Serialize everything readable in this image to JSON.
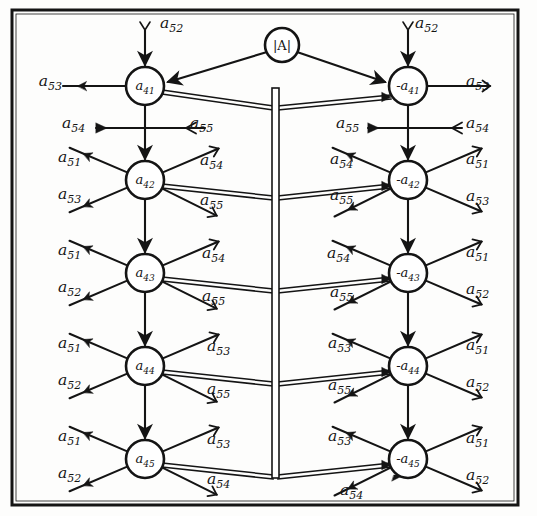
{
  "figure": {
    "background_color": "#fdfdfc",
    "ink_color": "#141414",
    "frame": {
      "x": 12,
      "y": 10,
      "width": 506,
      "height": 495,
      "stroke_width": 3
    }
  },
  "source_node": {
    "id": "det",
    "label": "|A|",
    "cx": 282,
    "cy": 45,
    "r": 17
  },
  "nodes": [
    {
      "id": "L1",
      "label": "a",
      "sub": "41",
      "sign": "",
      "cx": 145,
      "cy": 86,
      "r": 19,
      "side": "left"
    },
    {
      "id": "L2",
      "label": "a",
      "sub": "42",
      "sign": "",
      "cx": 145,
      "cy": 180,
      "r": 19,
      "side": "left"
    },
    {
      "id": "L3",
      "label": "a",
      "sub": "43",
      "sign": "",
      "cx": 145,
      "cy": 273,
      "r": 19,
      "side": "left"
    },
    {
      "id": "L4",
      "label": "a",
      "sub": "44",
      "sign": "",
      "cx": 145,
      "cy": 366,
      "r": 19,
      "side": "left"
    },
    {
      "id": "L5",
      "label": "a",
      "sub": "45",
      "sign": "",
      "cx": 145,
      "cy": 459,
      "r": 19,
      "side": "left"
    },
    {
      "id": "R1",
      "label": "a",
      "sub": "41",
      "sign": "-",
      "cx": 408,
      "cy": 86,
      "r": 19,
      "side": "right"
    },
    {
      "id": "R2",
      "label": "a",
      "sub": "42",
      "sign": "-",
      "cx": 408,
      "cy": 180,
      "r": 19,
      "side": "right"
    },
    {
      "id": "R3",
      "label": "a",
      "sub": "43",
      "sign": "-",
      "cx": 408,
      "cy": 273,
      "r": 19,
      "side": "right"
    },
    {
      "id": "R4",
      "label": "a",
      "sub": "44",
      "sign": "-",
      "cx": 408,
      "cy": 366,
      "r": 19,
      "side": "right"
    },
    {
      "id": "R5",
      "label": "a",
      "sub": "45",
      "sign": "-",
      "cx": 408,
      "cy": 459,
      "r": 19,
      "side": "right"
    }
  ],
  "bus_bar": {
    "x": 272,
    "y_top": 88,
    "y_bottom": 478,
    "width": 7
  },
  "branch_labels": {
    "left": [
      {
        "row": 1,
        "text": "a",
        "sub": "53",
        "x": 62,
        "y": 86,
        "dir": "in",
        "anchor": "end"
      },
      {
        "row": 1,
        "text": "a",
        "sub": "52",
        "x": 160,
        "y": 28,
        "dir": "in",
        "anchor": "start"
      },
      {
        "row": "1-2",
        "text": "a",
        "sub": "54",
        "x": 62,
        "y": 128,
        "dir": "in",
        "anchor": "start"
      },
      {
        "row": "1-2",
        "text": "a",
        "sub": "55",
        "x": 190,
        "y": 128,
        "dir": "out",
        "anchor": "start"
      },
      {
        "row": 2,
        "text": "a",
        "sub": "51",
        "x": 58,
        "y": 162,
        "dir": "in",
        "anchor": "start"
      },
      {
        "row": 2,
        "text": "a",
        "sub": "53",
        "x": 58,
        "y": 199,
        "dir": "in",
        "anchor": "start"
      },
      {
        "row": 2,
        "text": "a",
        "sub": "54",
        "x": 200,
        "y": 165,
        "dir": "out",
        "anchor": "start"
      },
      {
        "row": 2,
        "text": "a",
        "sub": "55",
        "x": 200,
        "y": 205,
        "dir": "out",
        "anchor": "start"
      },
      {
        "row": 3,
        "text": "a",
        "sub": "51",
        "x": 58,
        "y": 255,
        "dir": "in",
        "anchor": "start"
      },
      {
        "row": 3,
        "text": "a",
        "sub": "52",
        "x": 58,
        "y": 292,
        "dir": "in",
        "anchor": "start"
      },
      {
        "row": 3,
        "text": "a",
        "sub": "54",
        "x": 202,
        "y": 258,
        "dir": "out",
        "anchor": "start"
      },
      {
        "row": 3,
        "text": "a",
        "sub": "55",
        "x": 202,
        "y": 301,
        "dir": "out",
        "anchor": "start"
      },
      {
        "row": 4,
        "text": "a",
        "sub": "51",
        "x": 58,
        "y": 348,
        "dir": "in",
        "anchor": "start"
      },
      {
        "row": 4,
        "text": "a",
        "sub": "52",
        "x": 58,
        "y": 385,
        "dir": "in",
        "anchor": "start"
      },
      {
        "row": 4,
        "text": "a",
        "sub": "53",
        "x": 207,
        "y": 351,
        "dir": "out",
        "anchor": "start"
      },
      {
        "row": 4,
        "text": "a",
        "sub": "55",
        "x": 207,
        "y": 394,
        "dir": "out",
        "anchor": "start"
      },
      {
        "row": 5,
        "text": "a",
        "sub": "51",
        "x": 58,
        "y": 441,
        "dir": "in",
        "anchor": "start"
      },
      {
        "row": 5,
        "text": "a",
        "sub": "52",
        "x": 58,
        "y": 478,
        "dir": "in",
        "anchor": "start"
      },
      {
        "row": 5,
        "text": "a",
        "sub": "53",
        "x": 207,
        "y": 444,
        "dir": "out",
        "anchor": "start"
      },
      {
        "row": 5,
        "text": "a",
        "sub": "54",
        "x": 207,
        "y": 484,
        "dir": "out",
        "anchor": "start"
      }
    ],
    "right": [
      {
        "row": 1,
        "text": "a",
        "sub": "52",
        "x": 415,
        "y": 28,
        "dir": "in",
        "anchor": "start"
      },
      {
        "row": 1,
        "text": "a",
        "sub": "53",
        "x": 466,
        "y": 86,
        "dir": "out",
        "anchor": "start"
      },
      {
        "row": "1-2",
        "text": "a",
        "sub": "55",
        "x": 336,
        "y": 128,
        "dir": "in",
        "anchor": "start"
      },
      {
        "row": "1-2",
        "text": "a",
        "sub": "54",
        "x": 466,
        "y": 128,
        "dir": "out",
        "anchor": "start"
      },
      {
        "row": 2,
        "text": "a",
        "sub": "54",
        "x": 330,
        "y": 164,
        "dir": "in",
        "anchor": "start"
      },
      {
        "row": 2,
        "text": "a",
        "sub": "55",
        "x": 330,
        "y": 200,
        "dir": "in",
        "anchor": "start"
      },
      {
        "row": 2,
        "text": "a",
        "sub": "51",
        "x": 466,
        "y": 164,
        "dir": "out",
        "anchor": "start"
      },
      {
        "row": 2,
        "text": "a",
        "sub": "53",
        "x": 466,
        "y": 201,
        "dir": "out",
        "anchor": "start"
      },
      {
        "row": 3,
        "text": "a",
        "sub": "54",
        "x": 327,
        "y": 258,
        "dir": "in",
        "anchor": "start"
      },
      {
        "row": 3,
        "text": "a",
        "sub": "55",
        "x": 330,
        "y": 297,
        "dir": "in",
        "anchor": "start"
      },
      {
        "row": 3,
        "text": "a",
        "sub": "51",
        "x": 466,
        "y": 257,
        "dir": "out",
        "anchor": "start"
      },
      {
        "row": 3,
        "text": "a",
        "sub": "52",
        "x": 466,
        "y": 294,
        "dir": "out",
        "anchor": "start"
      },
      {
        "row": 4,
        "text": "a",
        "sub": "53",
        "x": 328,
        "y": 348,
        "dir": "in",
        "anchor": "start"
      },
      {
        "row": 4,
        "text": "a",
        "sub": "55",
        "x": 328,
        "y": 390,
        "dir": "in",
        "anchor": "start"
      },
      {
        "row": 4,
        "text": "a",
        "sub": "51",
        "x": 466,
        "y": 350,
        "dir": "out",
        "anchor": "start"
      },
      {
        "row": 4,
        "text": "a",
        "sub": "52",
        "x": 466,
        "y": 387,
        "dir": "out",
        "anchor": "start"
      },
      {
        "row": 5,
        "text": "a",
        "sub": "53",
        "x": 328,
        "y": 441,
        "dir": "in",
        "anchor": "start"
      },
      {
        "row": 5,
        "text": "a",
        "sub": "54",
        "x": 340,
        "y": 495,
        "dir": "in",
        "anchor": "start"
      },
      {
        "row": 5,
        "text": "a",
        "sub": "51",
        "x": 466,
        "y": 443,
        "dir": "out",
        "anchor": "start"
      },
      {
        "row": 5,
        "text": "a",
        "sub": "52",
        "x": 466,
        "y": 480,
        "dir": "out",
        "anchor": "start"
      }
    ]
  },
  "chart_data": {
    "type": "diagram",
    "left_nodes": [
      "a41",
      "a42",
      "a43",
      "a44",
      "a45"
    ],
    "right_nodes": [
      "-a41",
      "-a42",
      "-a43",
      "-a44",
      "-a45"
    ],
    "source": "|A|",
    "branch_gains": [
      "a51",
      "a52",
      "a53",
      "a54",
      "a55"
    ],
    "rows": [
      {
        "row": 1,
        "left_node": "a41",
        "left_in": [
          "a53",
          "a52"
        ],
        "left_out": [],
        "right_node": "-a41",
        "right_in": [
          "a52"
        ],
        "right_out": [
          "a53"
        ]
      },
      {
        "row": "1-2",
        "left_in": [
          "a54"
        ],
        "left_out": [
          "a55"
        ],
        "right_in": [
          "a55"
        ],
        "right_out": [
          "a54"
        ]
      },
      {
        "row": 2,
        "left_node": "a42",
        "left_in": [
          "a51",
          "a53"
        ],
        "left_out": [
          "a54",
          "a55"
        ],
        "right_node": "-a42",
        "right_in": [
          "a54",
          "a55"
        ],
        "right_out": [
          "a51",
          "a53"
        ]
      },
      {
        "row": 3,
        "left_node": "a43",
        "left_in": [
          "a51",
          "a52"
        ],
        "left_out": [
          "a54",
          "a55"
        ],
        "right_node": "-a43",
        "right_in": [
          "a54",
          "a55"
        ],
        "right_out": [
          "a51",
          "a52"
        ]
      },
      {
        "row": 4,
        "left_node": "a44",
        "left_in": [
          "a51",
          "a52"
        ],
        "left_out": [
          "a53",
          "a55"
        ],
        "right_node": "-a44",
        "right_in": [
          "a53",
          "a55"
        ],
        "right_out": [
          "a51",
          "a52"
        ]
      },
      {
        "row": 5,
        "left_node": "a45",
        "left_in": [
          "a51",
          "a52"
        ],
        "left_out": [
          "a53",
          "a54"
        ],
        "right_node": "-a45",
        "right_in": [
          "a53",
          "a54"
        ],
        "right_out": [
          "a51",
          "a52"
        ]
      }
    ]
  }
}
